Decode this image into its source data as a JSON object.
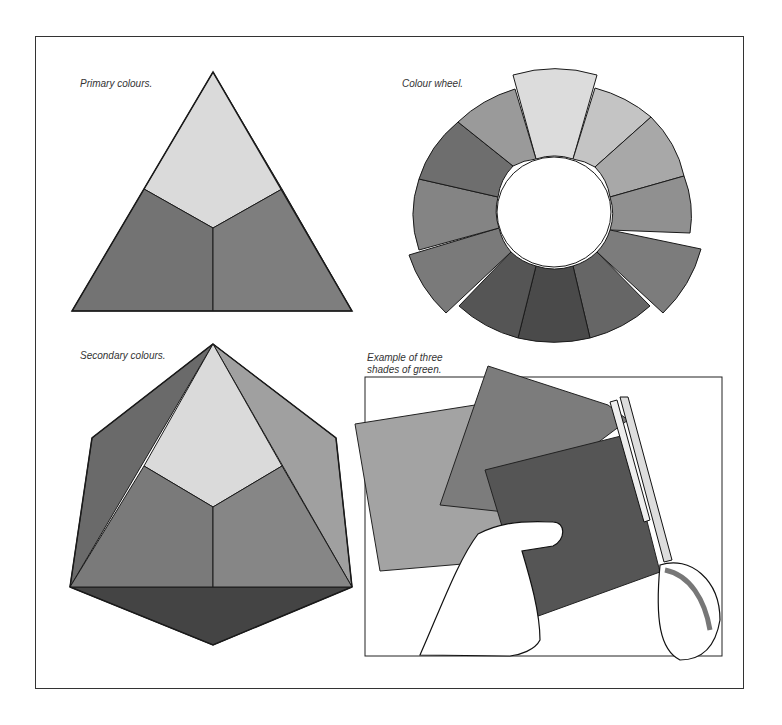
{
  "figures": {
    "primary": {
      "caption": "Primary colours."
    },
    "wheel": {
      "caption": "Colour wheel."
    },
    "secondary": {
      "caption": "Secondary colours."
    },
    "green": {
      "caption_line1": "Example of three",
      "caption_line2": "shades of green."
    }
  },
  "colors": {
    "light": "#d9d9d9",
    "mid": "#8a8a8a",
    "dark": "#6e6e6e",
    "darker": "#555555",
    "darkest": "#3f3f3f",
    "stroke": "#1a1a1a"
  }
}
